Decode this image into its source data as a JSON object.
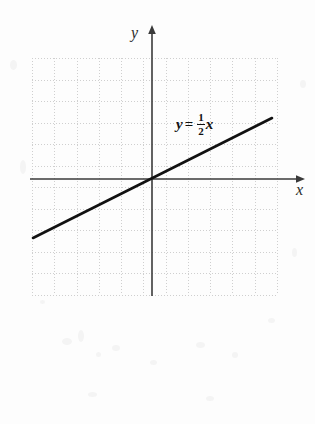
{
  "figure": {
    "name": "line-graph-y-equals-half-x",
    "background_color": "#fdfdfd",
    "grid": {
      "color": "#cfcfcf",
      "style": "dotted",
      "cell_size_px": 22,
      "columns": 11,
      "rows": 11,
      "left_px": 32,
      "top_px": 58,
      "width_px": 245,
      "height_px": 237
    },
    "axes": {
      "color": "#3a3a3a",
      "origin_x_px": 152,
      "origin_y_px": 179,
      "x_label": "x",
      "y_label": "y",
      "x_axis_arrow": "arrow-right",
      "y_axis_arrow": "arrow-up"
    },
    "equation": {
      "lhs": "y",
      "operator": "=",
      "numerator": "1",
      "denominator": "2",
      "variable": "x",
      "full_text": "y = 1/2 x",
      "color": "#111111"
    }
  },
  "chart_data": {
    "type": "line",
    "title": "",
    "xlabel": "x",
    "ylabel": "y",
    "grid": true,
    "legend": null,
    "xlim": [
      -5.5,
      5.7
    ],
    "ylim": [
      -5.3,
      5.5
    ],
    "series": [
      {
        "name": "y = 1/2 x",
        "equation": "y = 0.5x",
        "slope": 0.5,
        "intercept": 0,
        "color": "#111111",
        "x": [
          -5.4,
          5.45
        ],
        "y": [
          -2.7,
          2.73
        ],
        "points": [
          {
            "x": -5.4,
            "y": -2.7
          },
          {
            "x": -4,
            "y": -2
          },
          {
            "x": -2,
            "y": -1
          },
          {
            "x": 0,
            "y": 0
          },
          {
            "x": 2,
            "y": 1
          },
          {
            "x": 4,
            "y": 2
          },
          {
            "x": 5.45,
            "y": 2.73
          }
        ]
      }
    ],
    "annotations": [
      {
        "text": "y = 1/2 x",
        "x": 1.2,
        "y": 3.0
      }
    ]
  }
}
